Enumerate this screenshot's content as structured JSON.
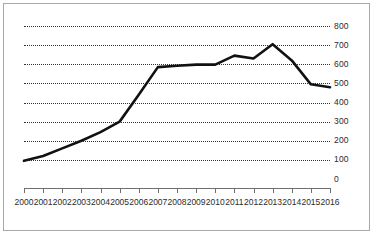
{
  "chart_data": {
    "type": "line",
    "title": "",
    "subtitle": "",
    "xlabel": "",
    "ylabel": "",
    "grid": true,
    "legend": false,
    "legend_position": "none",
    "line_color": "#111111",
    "grid_color": "#333333",
    "frame_color": "#a9a9a9",
    "axis_color": "#6e6e6e",
    "xlim": [
      2000,
      2016
    ],
    "ylim": [
      0,
      800
    ],
    "ytick_step": 100,
    "categories": [
      "2000",
      "2001",
      "2002",
      "2003",
      "2004",
      "2005",
      "2006",
      "2007",
      "2008",
      "2009",
      "2010",
      "2011",
      "2012",
      "2013",
      "2014",
      "2015",
      "2016"
    ],
    "ytick_labels": [
      "0",
      "100",
      "200",
      "300",
      "400",
      "500",
      "600",
      "700",
      "800"
    ],
    "ytick_values": [
      0,
      100,
      200,
      300,
      400,
      500,
      600,
      700,
      800
    ],
    "series": [
      {
        "name": "series-1",
        "values": [
          95,
          120,
          160,
          200,
          245,
          300,
          440,
          585,
          592,
          598,
          598,
          645,
          630,
          705,
          620,
          495,
          480
        ]
      }
    ]
  }
}
